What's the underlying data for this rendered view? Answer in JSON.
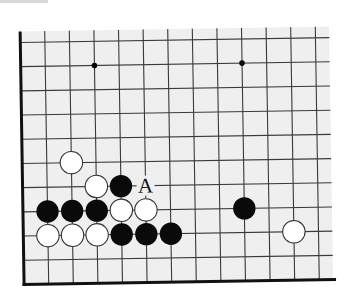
{
  "diagram": {
    "type": "go-board-fragment",
    "colors": {
      "board_bg": "#efefef",
      "grid_line": "#3a3a3a",
      "edge_line": "#111111",
      "black_stone": "#0a0a0a",
      "white_stone": "#ffffff",
      "white_outline": "#333333"
    },
    "grid": {
      "columns": 13,
      "rows": 10,
      "left_edge": true,
      "bottom_edge": true,
      "top_cut": true,
      "right_cut": true
    },
    "star_points": [
      {
        "col": 3,
        "row": 1
      },
      {
        "col": 9,
        "row": 1
      }
    ],
    "stones": [
      {
        "color": "white",
        "col": 2,
        "row": 5
      },
      {
        "color": "white",
        "col": 3,
        "row": 6
      },
      {
        "color": "black",
        "col": 4,
        "row": 6
      },
      {
        "color": "black",
        "col": 1,
        "row": 7
      },
      {
        "color": "black",
        "col": 2,
        "row": 7
      },
      {
        "color": "black",
        "col": 3,
        "row": 7
      },
      {
        "color": "white",
        "col": 4,
        "row": 7
      },
      {
        "color": "white",
        "col": 5,
        "row": 7
      },
      {
        "color": "black",
        "col": 9,
        "row": 7
      },
      {
        "color": "white",
        "col": 1,
        "row": 8
      },
      {
        "color": "white",
        "col": 2,
        "row": 8
      },
      {
        "color": "white",
        "col": 3,
        "row": 8
      },
      {
        "color": "black",
        "col": 4,
        "row": 8
      },
      {
        "color": "black",
        "col": 5,
        "row": 8
      },
      {
        "color": "black",
        "col": 6,
        "row": 8
      },
      {
        "color": "white",
        "col": 11,
        "row": 8
      }
    ],
    "labels": [
      {
        "text": "A",
        "col": 5,
        "row": 6
      }
    ]
  }
}
